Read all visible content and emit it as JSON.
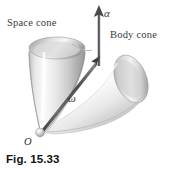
{
  "figure": {
    "caption": "Fig. 15.33",
    "background_color": "#ffffff",
    "ink_color": "#333333",
    "labels": {
      "space_cone": "Space cone",
      "body_cone": "Body cone",
      "alpha_vector": "α",
      "omega_vector": "ω",
      "origin_point": "O"
    },
    "geometry": {
      "apex_point": {
        "x": 40,
        "y": 131
      },
      "space_cone": {
        "name": "space-cone",
        "rim_center": {
          "x": 56,
          "y": 47
        },
        "rim_rx": 28,
        "rim_ry": 11,
        "fill_light": "#f4f4f4",
        "fill_mid": "#d2d2d2",
        "fill_dark": "#9c9c9c"
      },
      "body_cone": {
        "name": "body-cone",
        "rim_center": {
          "x": 131,
          "y": 85
        },
        "rim_rx": 16,
        "rim_ry": 26,
        "fill_light": "#fafafa",
        "fill_mid": "#dcdcdc",
        "fill_dark": "#a8a8a8"
      },
      "alpha_arrow": {
        "tail": {
          "x": 99,
          "y": 65
        },
        "head": {
          "x": 99,
          "y": 7
        }
      },
      "omega_arrow": {
        "tail": {
          "x": 41,
          "y": 130
        },
        "head": {
          "x": 100,
          "y": 57
        }
      }
    }
  }
}
